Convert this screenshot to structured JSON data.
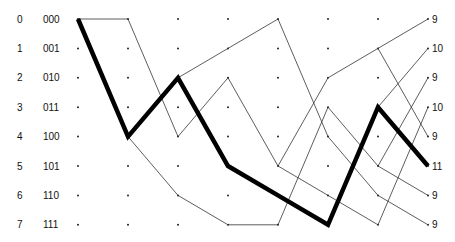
{
  "diagram": {
    "type": "trellis",
    "states": [
      {
        "index": "0",
        "binary": "000"
      },
      {
        "index": "1",
        "binary": "001"
      },
      {
        "index": "2",
        "binary": "010"
      },
      {
        "index": "3",
        "binary": "011"
      },
      {
        "index": "4",
        "binary": "100"
      },
      {
        "index": "5",
        "binary": "101"
      },
      {
        "index": "6",
        "binary": "110"
      },
      {
        "index": "7",
        "binary": "111"
      }
    ],
    "num_columns": 8,
    "final_metrics": [
      "9",
      "10",
      "9",
      "10",
      "9",
      "11",
      "9",
      "9"
    ],
    "thin_edges": [
      [
        [
          0,
          0
        ],
        [
          1,
          0
        ]
      ],
      [
        [
          1,
          0
        ],
        [
          2,
          4
        ]
      ],
      [
        [
          2,
          4
        ],
        [
          3,
          2
        ]
      ],
      [
        [
          3,
          2
        ],
        [
          4,
          5
        ]
      ],
      [
        [
          1,
          4
        ],
        [
          2,
          6
        ]
      ],
      [
        [
          2,
          6
        ],
        [
          3,
          7
        ]
      ],
      [
        [
          3,
          7
        ],
        [
          4,
          7
        ]
      ],
      [
        [
          2,
          2
        ],
        [
          3,
          1
        ]
      ],
      [
        [
          3,
          1
        ],
        [
          4,
          0
        ]
      ],
      [
        [
          4,
          0
        ],
        [
          5,
          4
        ]
      ],
      [
        [
          4,
          7
        ],
        [
          5,
          3
        ]
      ],
      [
        [
          4,
          5
        ],
        [
          5,
          2
        ]
      ],
      [
        [
          4,
          5
        ],
        [
          5,
          6
        ]
      ],
      [
        [
          5,
          2
        ],
        [
          6,
          1
        ]
      ],
      [
        [
          5,
          3
        ],
        [
          6,
          5
        ]
      ],
      [
        [
          5,
          4
        ],
        [
          6,
          6
        ]
      ],
      [
        [
          5,
          6
        ],
        [
          6,
          7
        ]
      ],
      [
        [
          6,
          1
        ],
        [
          7,
          0
        ]
      ],
      [
        [
          6,
          1
        ],
        [
          7,
          4
        ]
      ],
      [
        [
          6,
          3
        ],
        [
          7,
          1
        ]
      ],
      [
        [
          6,
          5
        ],
        [
          7,
          2
        ]
      ],
      [
        [
          6,
          5
        ],
        [
          7,
          6
        ]
      ],
      [
        [
          6,
          6
        ],
        [
          7,
          7
        ]
      ],
      [
        [
          6,
          7
        ],
        [
          7,
          3
        ]
      ]
    ],
    "survivor_path": [
      [
        0,
        0
      ],
      [
        1,
        4
      ],
      [
        2,
        2
      ],
      [
        3,
        5
      ],
      [
        4,
        6
      ],
      [
        5,
        7
      ],
      [
        6,
        3
      ],
      [
        7,
        5
      ]
    ],
    "colors": {
      "thin_line": "#333333",
      "thick_line": "#000000",
      "text": "#111111"
    }
  }
}
